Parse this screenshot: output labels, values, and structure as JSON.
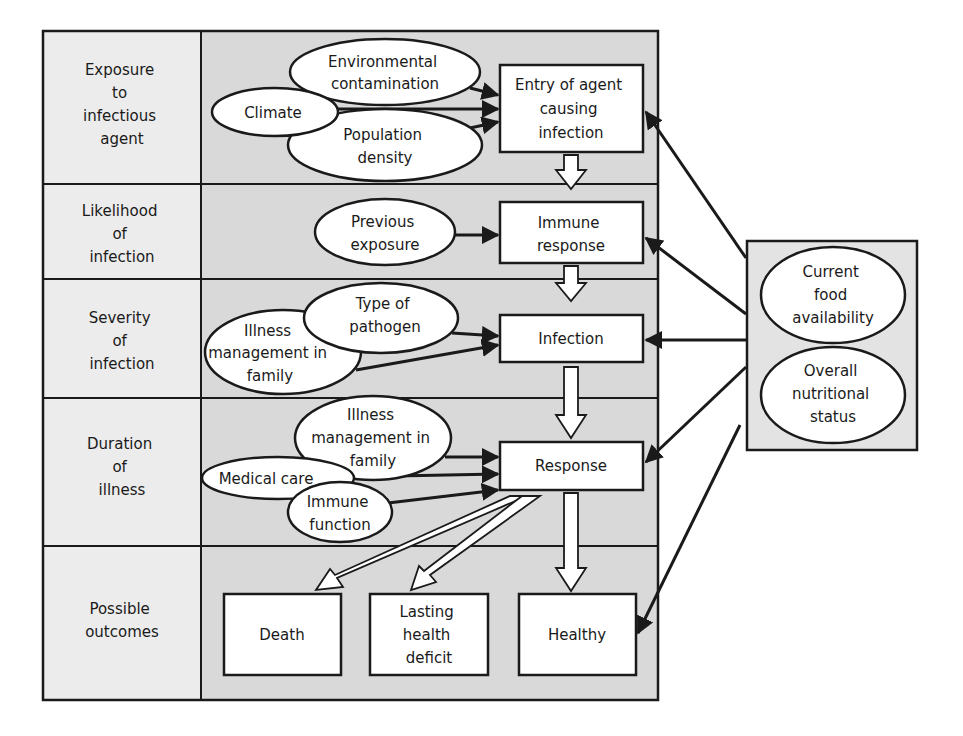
{
  "diagram": {
    "type": "flow-diagram",
    "colors": {
      "label_column_fill": "#ececec",
      "content_fill": "#d9d9d9",
      "side_box_fill": "#e3e3e3",
      "node_fill": "#ffffff",
      "stroke": "#1a1a1a"
    },
    "rows": [
      {
        "id": "exposure",
        "lines": [
          "Exposure",
          "to",
          "infectious",
          "agent"
        ]
      },
      {
        "id": "likelihood",
        "lines": [
          "Likelihood",
          "of",
          "infection"
        ]
      },
      {
        "id": "severity",
        "lines": [
          "Severity",
          "of",
          "infection"
        ]
      },
      {
        "id": "duration",
        "lines": [
          "Duration",
          "of",
          "illness"
        ]
      },
      {
        "id": "outcomes",
        "lines": [
          "Possible",
          "outcomes"
        ]
      }
    ],
    "ovals": {
      "environmental_contamination": [
        "Environmental",
        "contamination"
      ],
      "climate": [
        "Climate"
      ],
      "population_density": [
        "Population",
        "density"
      ],
      "previous_exposure": [
        "Previous",
        "exposure"
      ],
      "type_of_pathogen": [
        "Type of",
        "pathogen"
      ],
      "illness_management_severity": [
        "Illness",
        "management in",
        "family"
      ],
      "illness_management_duration": [
        "Illness",
        "management in",
        "family"
      ],
      "medical_care": [
        "Medical care"
      ],
      "immune_function": [
        "Immune",
        "function"
      ],
      "current_food_availability": [
        "Current",
        "food",
        "availability"
      ],
      "overall_nutritional_status": [
        "Overall",
        "nutritional",
        "status"
      ]
    },
    "boxes": {
      "entry_of_agent": [
        "Entry of agent",
        "causing",
        "infection"
      ],
      "immune_response": [
        "Immune",
        "response"
      ],
      "infection": [
        "Infection"
      ],
      "response": [
        "Response"
      ],
      "death": [
        "Death"
      ],
      "lasting_health_deficit": [
        "Lasting",
        "health",
        "deficit"
      ],
      "healthy": [
        "Healthy"
      ]
    },
    "edges": [
      {
        "from": "environmental_contamination",
        "to": "entry_of_agent",
        "style": "solid"
      },
      {
        "from": "climate",
        "to": "entry_of_agent",
        "style": "solid"
      },
      {
        "from": "population_density",
        "to": "entry_of_agent",
        "style": "solid"
      },
      {
        "from": "entry_of_agent",
        "to": "immune_response",
        "style": "hollow"
      },
      {
        "from": "previous_exposure",
        "to": "immune_response",
        "style": "solid"
      },
      {
        "from": "immune_response",
        "to": "infection",
        "style": "hollow"
      },
      {
        "from": "type_of_pathogen",
        "to": "infection",
        "style": "solid"
      },
      {
        "from": "illness_management_severity",
        "to": "infection",
        "style": "solid"
      },
      {
        "from": "infection",
        "to": "response",
        "style": "hollow"
      },
      {
        "from": "illness_management_duration",
        "to": "response",
        "style": "solid"
      },
      {
        "from": "medical_care",
        "to": "response",
        "style": "solid"
      },
      {
        "from": "immune_function",
        "to": "response",
        "style": "solid"
      },
      {
        "from": "response",
        "to": "death",
        "style": "hollow"
      },
      {
        "from": "response",
        "to": "lasting_health_deficit",
        "style": "hollow"
      },
      {
        "from": "response",
        "to": "healthy",
        "style": "hollow"
      },
      {
        "from": "nutrition_box",
        "to": "entry_of_agent",
        "style": "solid"
      },
      {
        "from": "nutrition_box",
        "to": "immune_response",
        "style": "solid"
      },
      {
        "from": "nutrition_box",
        "to": "infection",
        "style": "solid"
      },
      {
        "from": "nutrition_box",
        "to": "response",
        "style": "solid"
      },
      {
        "from": "nutrition_box",
        "to": "healthy",
        "style": "solid"
      }
    ]
  }
}
